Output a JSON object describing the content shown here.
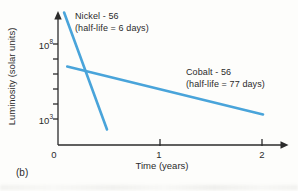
{
  "figure": {
    "panel_label": "(b)"
  },
  "chart_data": {
    "type": "line",
    "xlabel": "Time (years)",
    "ylabel": "Luminosity (solar units)",
    "grid": false,
    "legend": "inline-annotations",
    "x_axis": {
      "min": 0,
      "max": 2.25,
      "ticks": [
        {
          "value": 0,
          "label": "0"
        },
        {
          "value": 1,
          "label": "1"
        },
        {
          "value": 2,
          "label": "2"
        }
      ]
    },
    "y_axis": {
      "scale": "log10",
      "min_log10": 2,
      "max_log10": 10.3,
      "minor_ticks_log10": [
        3,
        4,
        5,
        6,
        7,
        8
      ],
      "labeled_ticks": [
        {
          "log10": 8,
          "mantissa": "10",
          "exponent": "8"
        },
        {
          "log10": 3,
          "mantissa": "10",
          "exponent": "3"
        }
      ]
    },
    "series": [
      {
        "name": "Nickel - 56",
        "annotation": "(half-life = 6 days)",
        "color": "#49a4da",
        "points": [
          {
            "x": 0.06,
            "log10_y": 10.1
          },
          {
            "x": 0.48,
            "log10_y": 2.3
          }
        ]
      },
      {
        "name": "Cobalt - 56",
        "annotation": "(half-life = 77 days)",
        "color": "#49a4da",
        "points": [
          {
            "x": 0.09,
            "log10_y": 6.5
          },
          {
            "x": 2.01,
            "log10_y": 3.3
          }
        ]
      }
    ]
  }
}
